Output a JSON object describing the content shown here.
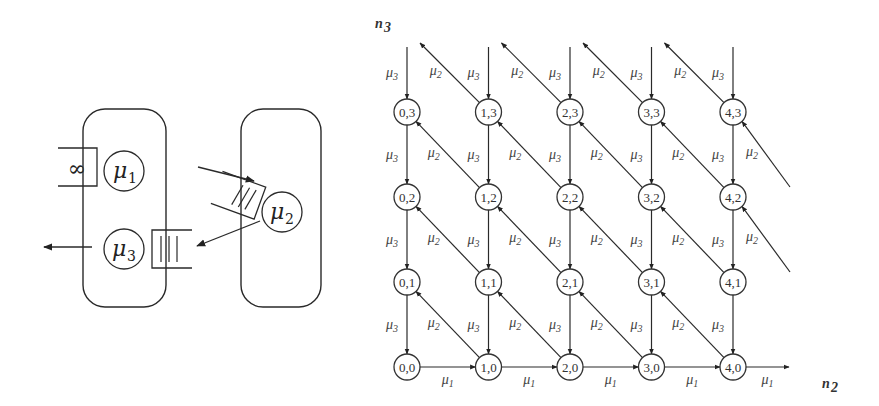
{
  "left_diagram": {
    "infinite_buffer_symbol": "∞",
    "station1": {
      "rate_symbol": "μ",
      "rate_index": "1"
    },
    "station2": {
      "rate_symbol": "μ",
      "rate_index": "2"
    },
    "station3": {
      "rate_symbol": "μ",
      "rate_index": "3"
    },
    "queue_bars": "|||"
  },
  "lattice": {
    "x_axis_label": "n",
    "x_axis_index": "2",
    "y_axis_label": "n",
    "y_axis_index": "3",
    "columns": [
      0,
      1,
      2,
      3,
      4
    ],
    "rows": [
      0,
      1,
      2,
      3
    ],
    "node_label_format": "{x},{y}",
    "nodes": [
      "0,0",
      "1,0",
      "2,0",
      "3,0",
      "4,0",
      "0,1",
      "1,1",
      "2,1",
      "3,1",
      "4,1",
      "0,2",
      "1,2",
      "2,2",
      "3,2",
      "4,2",
      "0,3",
      "1,3",
      "2,3",
      "3,3",
      "4,3"
    ],
    "transitions": {
      "horizontal": {
        "symbol": "μ",
        "index": "1",
        "direction": "n2+1 (right), only on row n3=0"
      },
      "vertical": {
        "symbol": "μ",
        "index": "3",
        "direction": "n3-1 (down)"
      },
      "diagonal": {
        "symbol": "μ",
        "index": "2",
        "direction": "n2-1, n3+1 (up-left)"
      }
    }
  }
}
